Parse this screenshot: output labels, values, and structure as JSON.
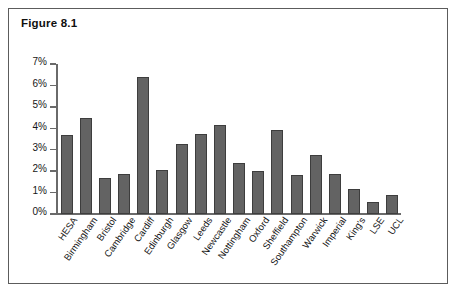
{
  "figure": {
    "title": "Figure 8.1"
  },
  "chart_data": {
    "type": "bar",
    "title": "Figure 8.1",
    "xlabel": "",
    "ylabel": "",
    "ylim": [
      0,
      7
    ],
    "ytick_labels": [
      "0%",
      "1%",
      "2%",
      "3%",
      "4%",
      "5%",
      "6%",
      "7%"
    ],
    "ytick_values": [
      0,
      1,
      2,
      3,
      4,
      5,
      6,
      7
    ],
    "grid": false,
    "legend": "none",
    "value_suffix": "%",
    "categories": [
      "HESA",
      "Birmingham",
      "Bristol",
      "Cambridge",
      "Cardiff",
      "Edinburgh",
      "Glasgow",
      "Leeds",
      "Newcastle",
      "Nottingham",
      "Oxford",
      "Sheffield",
      "Southampton",
      "Warwick",
      "Imperial",
      "King's",
      "LSE",
      "UCL"
    ],
    "values": [
      3.7,
      4.5,
      1.7,
      1.85,
      6.4,
      2.05,
      3.25,
      3.75,
      4.15,
      2.4,
      2.0,
      3.9,
      1.8,
      2.75,
      1.85,
      1.15,
      0.55,
      0.9
    ],
    "bar_color": "#636363",
    "bar_edge_color": "#3d3d3d",
    "axis_color": "#6a6a6a"
  }
}
